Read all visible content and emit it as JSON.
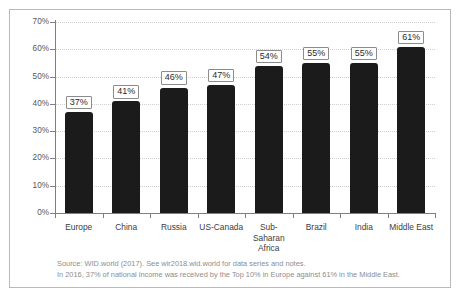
{
  "chart_data": {
    "type": "bar",
    "title": "",
    "subtitle": "",
    "xlabel": "",
    "ylabel": "Share of national income (%)",
    "ylim": [
      0,
      70
    ],
    "grid": true,
    "legend": "none",
    "categories": [
      "Europe",
      "China",
      "Russia",
      "US-Canada",
      "Sub-\nSaharan\nAfrica",
      "Brazil",
      "India",
      "Middle East"
    ],
    "values": [
      37,
      41,
      46,
      47,
      54,
      55,
      55,
      61
    ],
    "data_labels": [
      "37%",
      "41%",
      "46%",
      "47%",
      "54%",
      "55%",
      "55%",
      "61%"
    ],
    "ytick_labels": [
      "0%",
      "10%",
      "20%",
      "30%",
      "40%",
      "50%",
      "60%",
      "70%"
    ],
    "ytick_values": [
      0,
      10,
      20,
      30,
      40,
      50,
      60,
      70
    ],
    "bar_color": "#1b1b1b",
    "gridline_color": "#cfcfcf",
    "axis_color": "#808080"
  },
  "notes": {
    "source": "Source: WID.world (2017). See wir2018.wid.world for data series and notes.",
    "description": "In 2016, 37% of national income was received by the Top 10% in Europe against 61% in the Middle East."
  }
}
